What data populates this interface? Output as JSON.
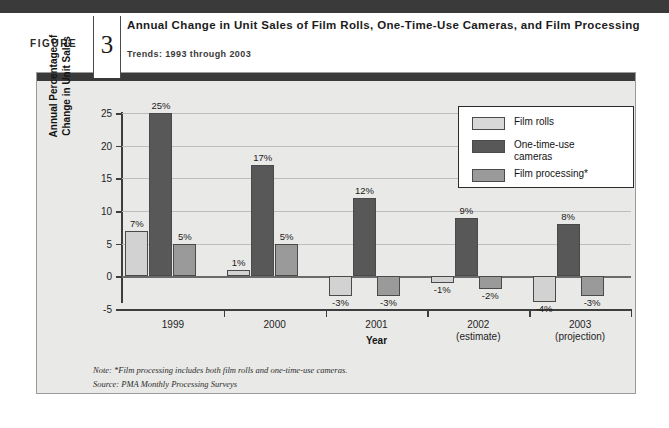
{
  "header": {
    "figure_word": "FIGURE",
    "figure_number": "3",
    "title": "Annual Change in Unit Sales of Film Rolls, One-Time-Use Cameras, and Film Processing",
    "subtitle": "Trends: 1993 through 2003"
  },
  "footnotes": {
    "note": "Note: *Film processing includes both film rolls and one-time-use cameras.",
    "source": "Source: PMA Monthly Processing Surveys"
  },
  "colors": {
    "series_film_rolls": "#d2d2d2",
    "series_one_time_use_cameras": "#585858",
    "series_film_processing": "#9a9a9a",
    "panel_background": "#e9e9e7",
    "panel_topbar": "#3a3a3a",
    "axis": "#3d3d3d",
    "gridline": "#bdbdbd"
  },
  "chart_data": {
    "type": "bar",
    "title": "Annual Change in Unit Sales of Film Rolls, One-Time-Use Cameras, and Film Processing",
    "subtitle": "Trends: 1993 through 2003",
    "xlabel": "Year",
    "ylabel": "Annual Percentage of Change in Unit Sales",
    "ylabel_lines": [
      "Annual Percentage of",
      "Change in Unit Sales"
    ],
    "categories": [
      "1999",
      "2000",
      "2001",
      "2002",
      "2003"
    ],
    "category_sublabels": [
      "",
      "",
      "",
      "(estimate)",
      "(projection)"
    ],
    "series": [
      {
        "name": "Film rolls",
        "color": "#d2d2d2",
        "values": [
          7,
          1,
          -3,
          -1,
          -4
        ],
        "labels": [
          "7%",
          "1%",
          "-3%",
          "-1%",
          "-4%"
        ]
      },
      {
        "name": "One-time-use cameras",
        "color": "#585858",
        "values": [
          25,
          17,
          12,
          9,
          8
        ],
        "labels": [
          "25%",
          "17%",
          "12%",
          "9%",
          "8%"
        ]
      },
      {
        "name": "Film processing*",
        "color": "#9a9a9a",
        "values": [
          5,
          5,
          -3,
          -2,
          -3
        ],
        "labels": [
          "5%",
          "5%",
          "-3%",
          "-2%",
          "-3%"
        ]
      }
    ],
    "ylim": [
      -5,
      25
    ],
    "yticks": [
      -5,
      0,
      5,
      10,
      15,
      20,
      25
    ],
    "ytick_labels": [
      "-5",
      "0",
      "5",
      "10",
      "15",
      "20",
      "25"
    ],
    "grid": true,
    "legend_position": "top-right",
    "legend_entries": [
      {
        "label_lines": [
          "Film rolls"
        ],
        "swatch": "s0"
      },
      {
        "label_lines": [
          "One-time-use",
          "cameras"
        ],
        "swatch": "s1"
      },
      {
        "label_lines": [
          "Film processing*"
        ],
        "swatch": "s2"
      }
    ]
  }
}
